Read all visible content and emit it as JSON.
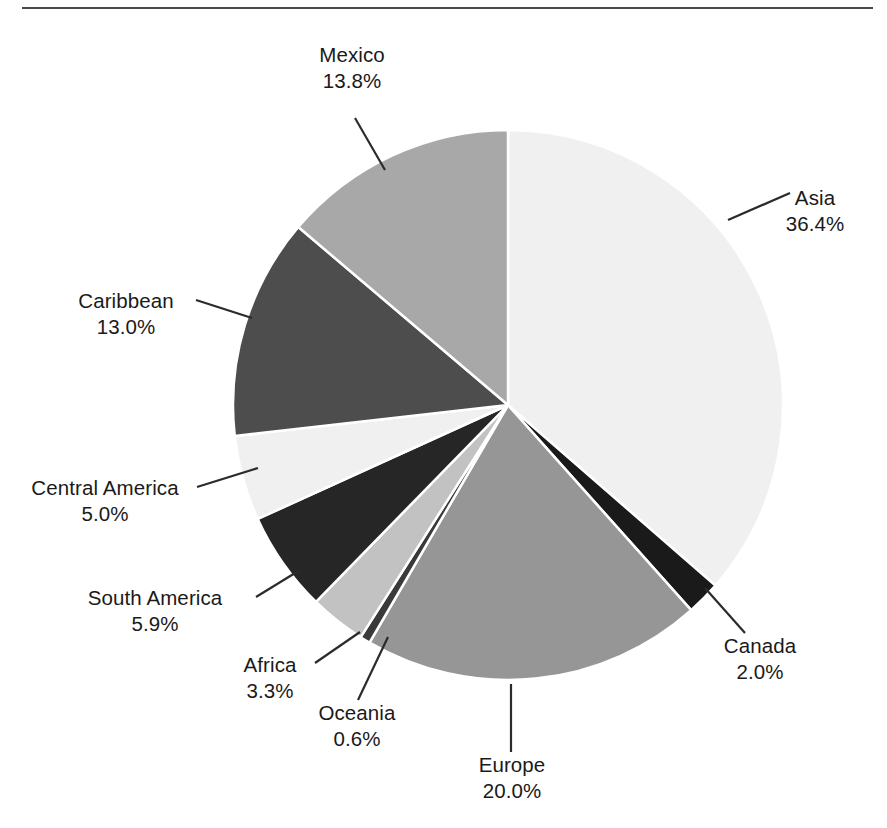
{
  "figure": {
    "type": "pie-chart",
    "background_color": "#ffffff",
    "rule_color": "#4a4a4a",
    "label_color": "#1a1a1a",
    "leader_line_color": "#2b2b2b"
  },
  "chart_data": {
    "type": "pie",
    "title": "",
    "xlabel": "",
    "ylabel": "",
    "legend_position": "none",
    "grid": false,
    "labels_show_percent": true,
    "start_angle_deg": 0,
    "direction": "clockwise",
    "categories": [
      "Asia",
      "Canada",
      "Europe",
      "Oceania",
      "Africa",
      "South America",
      "Central America",
      "Caribbean",
      "Mexico"
    ],
    "values": [
      36.4,
      2.0,
      20.0,
      0.6,
      3.3,
      5.9,
      5.0,
      13.0,
      13.8
    ],
    "value_labels": [
      "36.4%",
      "2.0%",
      "20.0%",
      "0.6%",
      "3.3%",
      "5.9%",
      "5.0%",
      "13.0%",
      "13.8%"
    ],
    "colors": [
      "#f0f0f0",
      "#1a1a1a",
      "#969696",
      "#3a3a3a",
      "#c2c2c2",
      "#262626",
      "#f0f0f0",
      "#4d4d4d",
      "#a8a8a8"
    ],
    "total": 100.0,
    "units": "percent"
  },
  "slices": [
    {
      "name": "Asia",
      "value": 36.4,
      "value_label": "36.4%",
      "color": "#f0f0f0"
    },
    {
      "name": "Canada",
      "value": 2.0,
      "value_label": "2.0%",
      "color": "#1a1a1a"
    },
    {
      "name": "Europe",
      "value": 20.0,
      "value_label": "20.0%",
      "color": "#969696"
    },
    {
      "name": "Oceania",
      "value": 0.6,
      "value_label": "0.6%",
      "color": "#3a3a3a"
    },
    {
      "name": "Africa",
      "value": 3.3,
      "value_label": "3.3%",
      "color": "#c2c2c2"
    },
    {
      "name": "South America",
      "value": 5.9,
      "value_label": "5.9%",
      "color": "#262626"
    },
    {
      "name": "Central America",
      "value": 5.0,
      "value_label": "5.0%",
      "color": "#f0f0f0"
    },
    {
      "name": "Caribbean",
      "value": 13.0,
      "value_label": "13.0%",
      "color": "#4d4d4d"
    },
    {
      "name": "Mexico",
      "value": 13.8,
      "value_label": "13.8%",
      "color": "#a8a8a8"
    }
  ],
  "labels": {
    "mexico": {
      "name": "Mexico",
      "value": "13.8%"
    },
    "asia": {
      "name": "Asia",
      "value": "36.4%"
    },
    "caribbean": {
      "name": "Caribbean",
      "value": "13.0%"
    },
    "central_america": {
      "name": "Central America",
      "value": "5.0%"
    },
    "south_america": {
      "name": "South America",
      "value": "5.9%"
    },
    "africa": {
      "name": "Africa",
      "value": "3.3%"
    },
    "oceania": {
      "name": "Oceania",
      "value": "0.6%"
    },
    "europe": {
      "name": "Europe",
      "value": "20.0%"
    },
    "canada": {
      "name": "Canada",
      "value": "2.0%"
    }
  }
}
